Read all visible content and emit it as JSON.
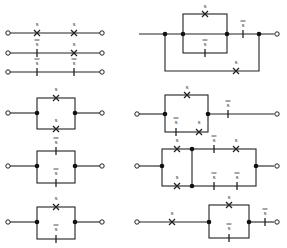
{
  "figure": {
    "symbols": {
      "open_contact": {
        "label": "s",
        "glyph": "X"
      },
      "closed_contact": {
        "label": "s",
        "overline": true,
        "glyph": "|"
      }
    },
    "colors": {
      "ink": "#222222",
      "background": "#ffffff"
    }
  },
  "circuits": [
    {
      "id": "L1",
      "type": "series",
      "contacts": [
        {
          "label": "s",
          "kind": "X"
        },
        {
          "label": "s",
          "kind": "X"
        }
      ]
    },
    {
      "id": "L2",
      "type": "series",
      "contacts": [
        {
          "label": "s",
          "overline": true,
          "kind": "bar"
        },
        {
          "label": "s",
          "kind": "X"
        }
      ]
    },
    {
      "id": "L3",
      "type": "series",
      "contacts": [
        {
          "label": "s",
          "overline": true,
          "kind": "bar"
        },
        {
          "label": "s",
          "overline": true,
          "kind": "bar"
        }
      ]
    },
    {
      "id": "L4",
      "type": "parallel",
      "top": {
        "label": "s",
        "kind": "X"
      },
      "bottom": {
        "label": "s",
        "kind": "X"
      }
    },
    {
      "id": "L5",
      "type": "parallel",
      "top": {
        "label": "s",
        "overline": true,
        "kind": "bar"
      },
      "bottom": {
        "label": "s",
        "overline": true,
        "kind": "bar"
      }
    },
    {
      "id": "L6",
      "type": "parallel",
      "top": {
        "label": "s",
        "kind": "X"
      },
      "bottom": {
        "label": "s",
        "overline": true,
        "kind": "bar"
      }
    },
    {
      "id": "R1",
      "type": "series-parallel",
      "inner_top": {
        "label": "s",
        "kind": "X"
      },
      "inner_bottom": {
        "label": "s",
        "overline": true,
        "kind": "bar"
      },
      "series": {
        "label": "s",
        "overline": true,
        "kind": "bar"
      },
      "bypass": {
        "label": "s",
        "kind": "X"
      }
    },
    {
      "id": "R2",
      "type": "parallel-series",
      "top": {
        "label": "s",
        "kind": "X"
      },
      "bottom": [
        {
          "label": "s",
          "overline": true,
          "kind": "bar"
        },
        {
          "label": "s",
          "kind": "X"
        }
      ],
      "series": {
        "label": "s",
        "overline": true,
        "kind": "bar"
      }
    },
    {
      "id": "R3",
      "type": "bridge",
      "top": [
        {
          "label": "s",
          "kind": "X"
        },
        {
          "label": "s",
          "overline": true,
          "kind": "bar"
        },
        {
          "label": "s",
          "kind": "X"
        }
      ],
      "bottom": [
        {
          "label": "s",
          "kind": "X"
        },
        {
          "label": "s",
          "overline": true,
          "kind": "bar"
        },
        {
          "label": "s",
          "overline": true,
          "kind": "bar"
        }
      ]
    },
    {
      "id": "R4",
      "type": "series-parallel",
      "lead": {
        "label": "s",
        "kind": "X"
      },
      "top": {
        "label": "s",
        "kind": "X"
      },
      "bottom": {
        "label": "s",
        "overline": true,
        "kind": "bar"
      },
      "series": {
        "label": "s",
        "overline": true,
        "kind": "bar"
      }
    }
  ],
  "labels": {
    "s": "s"
  }
}
